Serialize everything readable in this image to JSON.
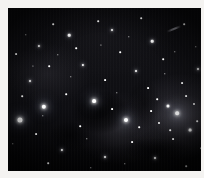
{
  "image": {
    "kind": "astronomical-star-field",
    "caption": "",
    "frame_color": "#f4f3f1",
    "sky_color": "#060608",
    "star_color": "#ffffff",
    "plate": {
      "x": 8,
      "y": 8,
      "width": 193,
      "height": 163
    }
  },
  "features": {
    "dark_nebula_label": "",
    "bright_cloud_label": "",
    "streak_label": ""
  },
  "stars": [
    {
      "x": 12,
      "y": 112,
      "r": 2.6,
      "glow": "glow"
    },
    {
      "x": 36,
      "y": 99,
      "r": 2.2,
      "glow": "glow"
    },
    {
      "x": 86,
      "y": 93,
      "r": 1.9,
      "glow": "glow"
    },
    {
      "x": 118,
      "y": 112,
      "r": 2.0,
      "glow": "glow"
    },
    {
      "x": 169,
      "y": 105,
      "r": 1.8,
      "glow": "glow"
    },
    {
      "x": 160,
      "y": 98,
      "r": 1.5,
      "glow": "softglow"
    },
    {
      "x": 182,
      "y": 122,
      "r": 1.4,
      "glow": "softglow"
    },
    {
      "x": 61,
      "y": 27,
      "r": 1.3,
      "glow": "softglow"
    },
    {
      "x": 144,
      "y": 33,
      "r": 1.3,
      "glow": "softglow"
    },
    {
      "x": 31,
      "y": 38,
      "r": 1.1,
      "glow": "softglow"
    },
    {
      "x": 104,
      "y": 22,
      "r": 1.0,
      "glow": "softglow"
    },
    {
      "x": 75,
      "y": 57,
      "r": 1.1,
      "glow": "softglow"
    },
    {
      "x": 128,
      "y": 63,
      "r": 1.0,
      "glow": "softglow"
    },
    {
      "x": 22,
      "y": 73,
      "r": 1.0,
      "glow": "softglow"
    },
    {
      "x": 54,
      "y": 142,
      "r": 1.1,
      "glow": "softglow"
    },
    {
      "x": 97,
      "y": 149,
      "r": 1.0,
      "glow": "softglow"
    },
    {
      "x": 147,
      "y": 150,
      "r": 1.0,
      "glow": "softglow"
    },
    {
      "x": 190,
      "y": 61,
      "r": 1.0,
      "glow": "softglow"
    },
    {
      "x": 8,
      "y": 46,
      "r": 0.9,
      "glow": ""
    },
    {
      "x": 45,
      "y": 16,
      "r": 0.8,
      "glow": ""
    },
    {
      "x": 90,
      "y": 13,
      "r": 0.8,
      "glow": ""
    },
    {
      "x": 133,
      "y": 10,
      "r": 0.8,
      "glow": ""
    },
    {
      "x": 176,
      "y": 16,
      "r": 0.8,
      "glow": ""
    },
    {
      "x": 18,
      "y": 27,
      "r": 0.7,
      "glow": ""
    },
    {
      "x": 68,
      "y": 40,
      "r": 0.8,
      "glow": ""
    },
    {
      "x": 112,
      "y": 44,
      "r": 0.8,
      "glow": ""
    },
    {
      "x": 155,
      "y": 51,
      "r": 0.8,
      "glow": ""
    },
    {
      "x": 188,
      "y": 39,
      "r": 0.7,
      "glow": ""
    },
    {
      "x": 41,
      "y": 58,
      "r": 0.8,
      "glow": ""
    },
    {
      "x": 97,
      "y": 72,
      "r": 0.9,
      "glow": ""
    },
    {
      "x": 140,
      "y": 80,
      "r": 0.9,
      "glow": ""
    },
    {
      "x": 174,
      "y": 75,
      "r": 0.9,
      "glow": ""
    },
    {
      "x": 14,
      "y": 88,
      "r": 0.8,
      "glow": ""
    },
    {
      "x": 58,
      "y": 86,
      "r": 0.8,
      "glow": ""
    },
    {
      "x": 104,
      "y": 101,
      "r": 0.9,
      "glow": ""
    },
    {
      "x": 151,
      "y": 115,
      "r": 1.0,
      "glow": ""
    },
    {
      "x": 186,
      "y": 96,
      "r": 1.0,
      "glow": ""
    },
    {
      "x": 28,
      "y": 126,
      "r": 0.9,
      "glow": ""
    },
    {
      "x": 72,
      "y": 118,
      "r": 0.8,
      "glow": ""
    },
    {
      "x": 124,
      "y": 134,
      "r": 0.9,
      "glow": ""
    },
    {
      "x": 165,
      "y": 131,
      "r": 0.9,
      "glow": ""
    },
    {
      "x": 40,
      "y": 155,
      "r": 0.8,
      "glow": ""
    },
    {
      "x": 83,
      "y": 160,
      "r": 0.7,
      "glow": ""
    },
    {
      "x": 117,
      "y": 156,
      "r": 0.7,
      "glow": ""
    },
    {
      "x": 178,
      "y": 158,
      "r": 0.8,
      "glow": ""
    },
    {
      "x": 5,
      "y": 136,
      "r": 0.7,
      "glow": ""
    },
    {
      "x": 63,
      "y": 69,
      "r": 0.7,
      "glow": ""
    },
    {
      "x": 109,
      "y": 85,
      "r": 0.7,
      "glow": ""
    },
    {
      "x": 157,
      "y": 66,
      "r": 0.7,
      "glow": ""
    },
    {
      "x": 35,
      "y": 108,
      "r": 0.7,
      "glow": ""
    },
    {
      "x": 79,
      "y": 131,
      "r": 0.7,
      "glow": ""
    },
    {
      "x": 131,
      "y": 119,
      "r": 0.8,
      "glow": ""
    },
    {
      "x": 193,
      "y": 140,
      "r": 0.8,
      "glow": ""
    },
    {
      "x": 50,
      "y": 47,
      "r": 0.7,
      "glow": ""
    },
    {
      "x": 121,
      "y": 29,
      "r": 0.7,
      "glow": ""
    },
    {
      "x": 167,
      "y": 44,
      "r": 0.7,
      "glow": ""
    },
    {
      "x": 25,
      "y": 58,
      "r": 0.6,
      "glow": ""
    },
    {
      "x": 93,
      "y": 37,
      "r": 0.6,
      "glow": ""
    },
    {
      "x": 143,
      "y": 103,
      "r": 0.9,
      "glow": ""
    },
    {
      "x": 178,
      "y": 88,
      "r": 0.9,
      "glow": ""
    },
    {
      "x": 162,
      "y": 122,
      "r": 0.8,
      "glow": ""
    },
    {
      "x": 149,
      "y": 91,
      "r": 0.8,
      "glow": ""
    },
    {
      "x": 189,
      "y": 113,
      "r": 0.8,
      "glow": ""
    }
  ],
  "streak": {
    "x": 166,
    "y": 21
  }
}
